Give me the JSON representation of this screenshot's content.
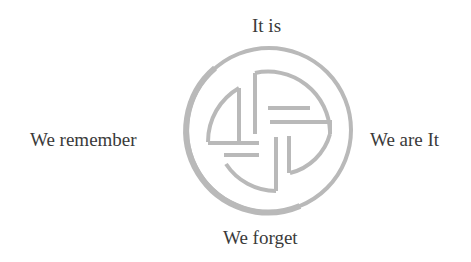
{
  "diagram": {
    "center_symbol": {
      "icon": "circular-pinwheel-symbol",
      "stroke_color": "#b9b9b9"
    },
    "labels": {
      "top": "It is",
      "left": "We remember",
      "right": "We are It",
      "bottom": "We forget"
    },
    "text_color": "#3a3a3a",
    "background": "#ffffff"
  }
}
